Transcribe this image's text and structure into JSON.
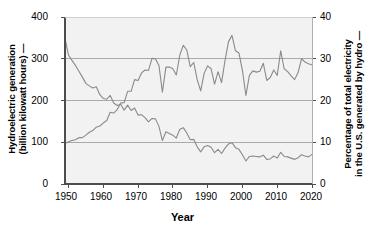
{
  "chart_data": {
    "type": "line",
    "title": "",
    "xlabel": "Year",
    "xlim": [
      1949,
      2020
    ],
    "xticks": [
      1950,
      1960,
      1970,
      1980,
      1990,
      2000,
      2010,
      2020
    ],
    "grid": true,
    "legend": "none",
    "axes": [
      {
        "id": "left",
        "label_lines": [
          "Hydroelectric generation",
          "(billion kilowatt hours) —"
        ],
        "ylim": [
          0,
          400
        ],
        "yticks": [
          0,
          100,
          200,
          300,
          400
        ]
      },
      {
        "id": "right",
        "label_lines": [
          "Percentage of total electricity",
          "in the U.S. generated by hydro —"
        ],
        "ylim": [
          0,
          40
        ],
        "yticks": [
          0,
          10,
          20,
          30,
          40
        ]
      }
    ],
    "series": [
      {
        "name": "Hydroelectric generation",
        "axis": "left",
        "units": "billion kilowatt hours",
        "color": "#8a8a8a",
        "x": [
          1949,
          1950,
          1951,
          1952,
          1953,
          1954,
          1955,
          1956,
          1957,
          1958,
          1959,
          1960,
          1961,
          1962,
          1963,
          1964,
          1965,
          1966,
          1967,
          1968,
          1969,
          1970,
          1971,
          1972,
          1973,
          1974,
          1975,
          1976,
          1977,
          1978,
          1979,
          1980,
          1981,
          1982,
          1983,
          1984,
          1985,
          1986,
          1987,
          1988,
          1989,
          1990,
          1991,
          1992,
          1993,
          1994,
          1995,
          1996,
          1997,
          1998,
          1999,
          2000,
          2001,
          2002,
          2003,
          2004,
          2005,
          2006,
          2007,
          2008,
          2009,
          2010,
          2011,
          2012,
          2013,
          2014,
          2015,
          2016,
          2017,
          2018,
          2019,
          2020
        ],
        "values": [
          97,
          101,
          104,
          106,
          111,
          111,
          117,
          124,
          128,
          136,
          139,
          146,
          152,
          172,
          170,
          178,
          194,
          195,
          222,
          222,
          250,
          248,
          266,
          273,
          272,
          301,
          300,
          284,
          220,
          280,
          280,
          276,
          261,
          309,
          332,
          321,
          281,
          291,
          250,
          223,
          265,
          283,
          276,
          239,
          269,
          243,
          296,
          341,
          356,
          319,
          314,
          272,
          212,
          260,
          271,
          268,
          270,
          289,
          248,
          255,
          273,
          260,
          319,
          276,
          269,
          259,
          250,
          267,
          300,
          292,
          288,
          285
        ]
      },
      {
        "name": "Percentage of total electricity in the U.S. generated by hydro",
        "axis": "right",
        "units": "percent",
        "color": "#8a8a8a",
        "x": [
          1949,
          1950,
          1951,
          1952,
          1953,
          1954,
          1955,
          1956,
          1957,
          1958,
          1959,
          1960,
          1961,
          1962,
          1963,
          1964,
          1965,
          1966,
          1967,
          1968,
          1969,
          1970,
          1971,
          1972,
          1973,
          1974,
          1975,
          1976,
          1977,
          1978,
          1979,
          1980,
          1981,
          1982,
          1983,
          1984,
          1985,
          1986,
          1987,
          1988,
          1989,
          1990,
          1991,
          1992,
          1993,
          1994,
          1995,
          1996,
          1997,
          1998,
          1999,
          2000,
          2001,
          2002,
          2003,
          2004,
          2005,
          2006,
          2007,
          2008,
          2009,
          2010,
          2011,
          2012,
          2013,
          2014,
          2015,
          2016,
          2017,
          2018,
          2019,
          2020
        ],
        "values": [
          34.9,
          30.9,
          29.6,
          28.4,
          27.0,
          25.6,
          24.1,
          23.5,
          23.0,
          23.3,
          21.4,
          20.5,
          20.3,
          21.2,
          19.4,
          18.8,
          19.1,
          17.7,
          18.9,
          17.6,
          18.2,
          16.5,
          16.6,
          15.9,
          14.9,
          15.7,
          15.6,
          13.8,
          10.4,
          12.5,
          12.1,
          11.7,
          11.0,
          13.1,
          13.5,
          12.2,
          10.6,
          10.7,
          8.9,
          7.7,
          8.9,
          9.2,
          8.8,
          7.5,
          8.3,
          7.3,
          8.6,
          9.6,
          9.9,
          8.7,
          8.3,
          7.0,
          5.5,
          6.6,
          6.7,
          6.6,
          6.5,
          6.9,
          5.9,
          6.0,
          6.7,
          6.2,
          7.6,
          6.6,
          6.5,
          6.2,
          5.9,
          6.3,
          7.0,
          6.7,
          6.5,
          7.1
        ]
      }
    ]
  },
  "layout": {
    "plot": {
      "left": 65,
      "top": 17,
      "right": 312,
      "bottom": 184
    },
    "colors": {
      "plot_background": "#f2f2f2",
      "gridline": "#8c8c8c",
      "axis": "#4d4d4d",
      "series": "#8a8a8a"
    }
  }
}
